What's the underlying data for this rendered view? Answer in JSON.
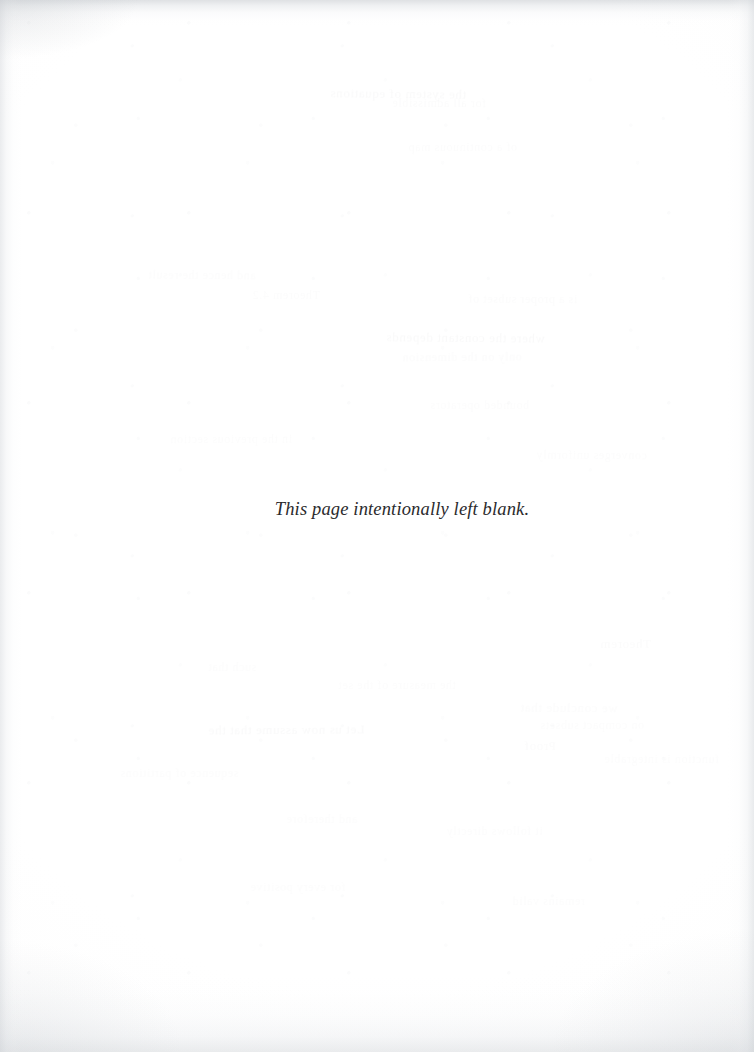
{
  "page": {
    "width": 754,
    "height": 1052,
    "background_color": "#fefefe",
    "paper_tone": "#ffffff",
    "kind": "scanned-book-page"
  },
  "content": {
    "notice": "This page intentionally left blank.",
    "notice_style": "italic-serif",
    "notice_color": "#2b2b2d",
    "notice_font_size_px": 18.5,
    "notice_baseline_y": 515,
    "notice_left_x": 285,
    "notice_right_x": 519
  },
  "artifacts": {
    "edge_shadow_color": "#d6dade",
    "top_edge_color": "#e8eaec",
    "side_edge_color": "#f2f2f3",
    "bottom_edge_color": "#eeeff1",
    "showthrough_color": "#4a4a52",
    "showthrough_ghosts": [
      {
        "text": "the system of equations",
        "x": 330,
        "y": 86,
        "size": 13,
        "rot": -0.6,
        "class": "ghost"
      },
      {
        "text": "for all admissible",
        "x": 392,
        "y": 96,
        "size": 12,
        "rot": -0.4,
        "class": "ghost-faint"
      },
      {
        "text": "of a continuous map",
        "x": 408,
        "y": 140,
        "size": 12,
        "rot": 0.3,
        "class": "ghost-fainter"
      },
      {
        "text": "and hence the result",
        "x": 148,
        "y": 268,
        "size": 12,
        "rot": -0.5,
        "class": "ghost-fainter"
      },
      {
        "text": "Theorem 4.2",
        "x": 252,
        "y": 288,
        "size": 12,
        "rot": 0.2,
        "class": "ghost-fainter"
      },
      {
        "text": "is a proper subset of",
        "x": 468,
        "y": 292,
        "size": 12,
        "rot": -0.3,
        "class": "ghost-faint"
      },
      {
        "text": "where the constant depends",
        "x": 386,
        "y": 330,
        "size": 13,
        "rot": -0.5,
        "class": "ghost"
      },
      {
        "text": "only on the dimension",
        "x": 402,
        "y": 350,
        "size": 12,
        "rot": 0.4,
        "class": "ghost-faint"
      },
      {
        "text": "bounded operators",
        "x": 430,
        "y": 398,
        "size": 12,
        "rot": -0.2,
        "class": "ghost-fainter"
      },
      {
        "text": "in the previous section",
        "x": 170,
        "y": 432,
        "size": 12,
        "rot": 0.3,
        "class": "ghost-fainter"
      },
      {
        "text": "converges uniformly",
        "x": 536,
        "y": 448,
        "size": 12,
        "rot": -0.4,
        "class": "ghost-fainter"
      },
      {
        "text": "Theorem",
        "x": 600,
        "y": 636,
        "size": 13,
        "rot": 0.3,
        "class": "ghost-faint"
      },
      {
        "text": "such that",
        "x": 208,
        "y": 660,
        "size": 12,
        "rot": -0.3,
        "class": "ghost-fainter"
      },
      {
        "text": "the measure of the set",
        "x": 338,
        "y": 678,
        "size": 12,
        "rot": 0.2,
        "class": "ghost-fainter"
      },
      {
        "text": "we conclude that",
        "x": 520,
        "y": 700,
        "size": 13,
        "rot": -0.5,
        "class": "ghost-faint"
      },
      {
        "text": "on compact subsets",
        "x": 540,
        "y": 718,
        "size": 12,
        "rot": 0.3,
        "class": "ghost-fainter"
      },
      {
        "text": "Proof",
        "x": 524,
        "y": 738,
        "size": 13,
        "rot": -0.2,
        "class": "ghost-faint"
      },
      {
        "text": "Let us now assume that the",
        "x": 208,
        "y": 722,
        "size": 13,
        "rot": 0.4,
        "class": "ghost"
      },
      {
        "text": "function is integrable",
        "x": 604,
        "y": 752,
        "size": 12,
        "rot": -0.3,
        "class": "ghost-fainter"
      },
      {
        "text": "sequence of partitions",
        "x": 120,
        "y": 766,
        "size": 12,
        "rot": 0.2,
        "class": "ghost-fainter"
      },
      {
        "text": "and therefore",
        "x": 286,
        "y": 812,
        "size": 12,
        "rot": -0.4,
        "class": "ghost-fainter"
      },
      {
        "text": "it follows directly",
        "x": 446,
        "y": 824,
        "size": 12,
        "rot": 0.3,
        "class": "ghost-fainter"
      },
      {
        "text": "for every positive",
        "x": 250,
        "y": 880,
        "size": 12,
        "rot": -0.2,
        "class": "ghost-fainter"
      },
      {
        "text": "remains valid",
        "x": 512,
        "y": 894,
        "size": 12,
        "rot": 0.4,
        "class": "ghost-fainter"
      }
    ]
  }
}
